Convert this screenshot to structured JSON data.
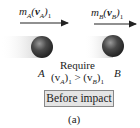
{
  "diagram": {
    "momentum_a": {
      "m": "m",
      "sub_m": "A",
      "v": "v",
      "sub_v": "A",
      "sub_t": "1"
    },
    "momentum_b": {
      "m": "m",
      "sub_m": "B",
      "v": "v",
      "sub_v": "B",
      "sub_t": "1"
    },
    "ball_a_label": "A",
    "ball_b_label": "B",
    "require_text": "Require",
    "condition": {
      "left": "(v",
      "left_sub": "A",
      "left_close": ")",
      "left_t": "1",
      "op": " > ",
      "right": "(v",
      "right_sub": "B",
      "right_close": ")",
      "right_t": "1"
    },
    "stage_label": "Before impact",
    "caption": "(a)",
    "colors": {
      "ball": "#3a3a3a",
      "trail": "#d8d8d8",
      "box": "#e4e4e4",
      "arrow": "#222222"
    }
  }
}
